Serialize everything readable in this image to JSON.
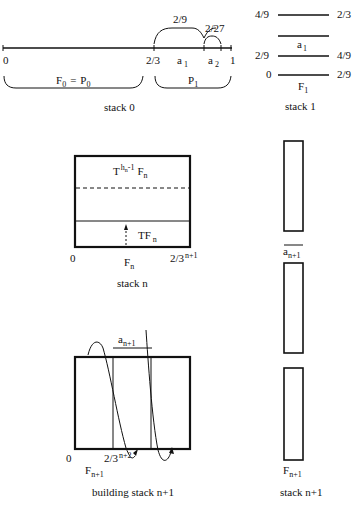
{
  "stack0": {
    "caption": "stack 0",
    "ticks": [
      "0",
      "2/3",
      "1"
    ],
    "interval_labels": {
      "a1": "a",
      "a1_sub": "1",
      "a2": "a",
      "a2_sub": "2"
    },
    "brace_top_1": "2/9",
    "brace_top_2": "2/27",
    "brace_bottom_left": {
      "F": "F",
      "F_sub": "0",
      "eq": "=",
      "P": "P",
      "P_sub": "0"
    },
    "brace_bottom_right": {
      "P": "P",
      "P_sub": "1"
    }
  },
  "stack1": {
    "caption": "stack 1",
    "levels": [
      {
        "left": "4/9",
        "right": "2/3"
      },
      {
        "label": "a",
        "label_sub": "1"
      },
      {
        "left": "2/9",
        "right": "4/9"
      },
      {
        "left": "0",
        "right": "2/9"
      }
    ],
    "base_label": "F",
    "base_sub": "1"
  },
  "stackN": {
    "caption": "stack n",
    "top_label": {
      "T": "T",
      "sup": "h",
      "sup_sub": "n",
      "sup_rest": "-1",
      "F": "F",
      "F_sub": "n"
    },
    "inner_label": {
      "T": "TF",
      "sub": "n"
    },
    "left_tick": "0",
    "right_tick": "2/3",
    "right_tick_sup": "n+1",
    "base_label": "F",
    "base_sub": "n"
  },
  "building": {
    "caption": "building stack n+1",
    "top_label": "a",
    "top_sub": "n+1",
    "left_tick": "0",
    "mid_tick": "2/3",
    "mid_tick_sup": "n+2",
    "base_label": "F",
    "base_sub": "n+1"
  },
  "stackN1": {
    "caption": "stack n+1",
    "sep_label": "a",
    "sep_sub": "n+1",
    "base_label": "F",
    "base_sub": "n+1"
  }
}
